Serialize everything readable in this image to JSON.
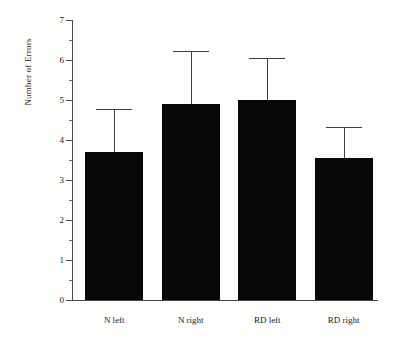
{
  "chart_data": {
    "type": "bar",
    "title": "",
    "xlabel": "",
    "ylabel": "Number of Errors",
    "categories": [
      "N left",
      "N right",
      "RD left",
      "RD right"
    ],
    "values": [
      3.7,
      4.9,
      5.0,
      3.55
    ],
    "error_upper": [
      4.78,
      6.22,
      6.06,
      4.32
    ],
    "error_bars": "upper-only",
    "ylim": [
      0,
      7
    ],
    "ytick_step": 1,
    "yminor_step": 0.5,
    "ytick_labels": [
      "0",
      "1",
      "2",
      "3",
      "4",
      "5",
      "6",
      "7"
    ],
    "grid": false,
    "legend": false,
    "bar_color": "#070707",
    "axis_color": "#4a4a4a",
    "background_color": "#fdfdfb"
  }
}
